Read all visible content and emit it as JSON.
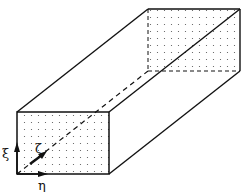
{
  "diagram": {
    "type": "3d-rectangular-duct-with-computational-coordinates",
    "axes": [
      {
        "name": "xi",
        "label": "ξ",
        "direction": "vertical"
      },
      {
        "name": "eta",
        "label": "η",
        "direction": "horizontal"
      },
      {
        "name": "zeta",
        "label": "ζ",
        "direction": "streamwise-depth"
      }
    ],
    "faces": {
      "front": {
        "grid": "dotted",
        "corners": [
          [
            17,
            112
          ],
          [
            109,
            112
          ],
          [
            109,
            174
          ],
          [
            17,
            174
          ]
        ]
      },
      "back": {
        "grid": "dotted",
        "corners": [
          [
            148,
            9
          ],
          [
            240,
            9
          ],
          [
            240,
            71
          ],
          [
            148,
            71
          ]
        ]
      }
    },
    "colors": {
      "line": "#111111",
      "background": "#ffffff",
      "dots": "#555555"
    }
  }
}
